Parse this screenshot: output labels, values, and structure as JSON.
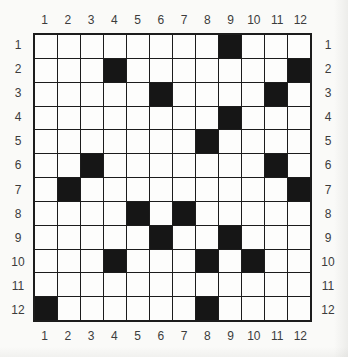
{
  "puzzle": {
    "size": {
      "rows": 12,
      "cols": 12
    },
    "col_labels_top": [
      "1",
      "2",
      "3",
      "4",
      "5",
      "6",
      "7",
      "8",
      "9",
      "10",
      "11",
      "12"
    ],
    "col_labels_bottom": [
      "1",
      "2",
      "3",
      "4",
      "5",
      "6",
      "7",
      "8",
      "9",
      "10",
      "11",
      "12"
    ],
    "row_labels_left": [
      "1",
      "2",
      "3",
      "4",
      "5",
      "6",
      "7",
      "8",
      "9",
      "10",
      "11",
      "12"
    ],
    "row_labels_right": [
      "1",
      "2",
      "3",
      "4",
      "5",
      "6",
      "7",
      "8",
      "9",
      "10",
      "11",
      "12"
    ],
    "black_cells": [
      [
        1,
        9
      ],
      [
        2,
        4
      ],
      [
        2,
        12
      ],
      [
        3,
        6
      ],
      [
        3,
        11
      ],
      [
        4,
        9
      ],
      [
        5,
        8
      ],
      [
        6,
        3
      ],
      [
        6,
        11
      ],
      [
        7,
        2
      ],
      [
        7,
        12
      ],
      [
        8,
        5
      ],
      [
        8,
        7
      ],
      [
        9,
        6
      ],
      [
        9,
        9
      ],
      [
        10,
        4
      ],
      [
        10,
        8
      ],
      [
        10,
        10
      ],
      [
        12,
        1
      ],
      [
        12,
        8
      ]
    ]
  },
  "colors": {
    "background": "#fafaf8",
    "cell_white": "#fdfdfc",
    "cell_black": "#161616",
    "grid_line": "#1c1c1c",
    "label_text": "#3c3c3c"
  }
}
